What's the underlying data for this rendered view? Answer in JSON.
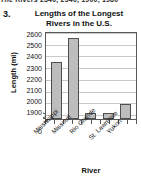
{
  "page": {
    "top_fragment": "The Rivers   2340, 2540, 1900, 1980",
    "problem_number": "3."
  },
  "chart_data": {
    "type": "bar",
    "title": "Lengths of the Longest Rivers in the U.S.",
    "title_line1": "Lengths of the Longest",
    "title_line2": "Rivers in the U.S.",
    "xlabel": "River",
    "ylabel": "Length (mi)",
    "categories": [
      "Mississippi",
      "Missouri",
      "Rio Grande",
      "St. Lawrence",
      "Yukon"
    ],
    "values": [
      2340,
      2540,
      1900,
      1900,
      1980
    ],
    "ylim": [
      1850,
      2600
    ],
    "axis_break": true,
    "axis_break_note": "y-axis broken between 0 and 1900",
    "yticks": [
      "2600",
      "2500",
      "2400",
      "2300",
      "2200",
      "2100",
      "2000",
      "1900",
      "0"
    ],
    "grid": true,
    "legend": "none",
    "bar_fill_color": "#bdbdbd",
    "bar_border_color": "#4f4f4f",
    "gridline_color": "#c9c9c9",
    "plot_border_color": "#585858",
    "background_color": "#ffffff"
  }
}
